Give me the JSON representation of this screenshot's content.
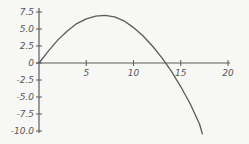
{
  "chart_data": {
    "type": "line",
    "title": "",
    "xlabel": "",
    "ylabel": "",
    "xlim": [
      0,
      20
    ],
    "ylim": [
      -10,
      7.5
    ],
    "grid": false,
    "legend": null,
    "x_ticks": [
      "5",
      "10",
      "15",
      "20"
    ],
    "y_ticks": [
      "7.5",
      "5.0",
      "2.5",
      "0",
      "-2.5",
      "-5.0",
      "-7.5",
      "-10.0"
    ],
    "series": [
      {
        "name": "curve",
        "x": [
          0,
          1,
          2,
          3,
          4,
          5,
          6,
          7,
          8,
          9,
          10,
          11,
          12,
          13,
          14,
          15,
          16,
          17,
          17.3
        ],
        "y": [
          0,
          1.8,
          3.4,
          4.7,
          5.8,
          6.5,
          6.9,
          7.0,
          6.8,
          6.2,
          5.2,
          4.0,
          2.5,
          0.8,
          -1.2,
          -3.5,
          -6.0,
          -9.0,
          -10.5
        ]
      }
    ]
  },
  "colors": {
    "line": "#5a5a5a",
    "axis": "#5a5a5a",
    "background": "#f7f7f5"
  }
}
